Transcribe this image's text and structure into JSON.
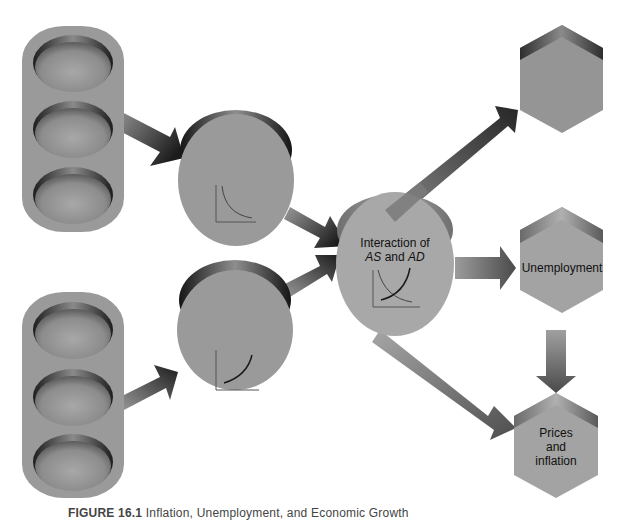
{
  "diagram": {
    "colors": {
      "background": "#ffffff",
      "shape_fill": "#9a9a9a",
      "shape_fill_light": "#a9a9a9",
      "shape_dark": "#2a2a2a",
      "arrow_dark": "#2e2e2e",
      "arrow_light": "#a0a0a0",
      "text": "#111111"
    },
    "nodes": [
      {
        "id": "top-stack",
        "shape": "stack-of-three-ovals",
        "label": ""
      },
      {
        "id": "bottom-stack",
        "shape": "stack-of-three-ovals",
        "label": ""
      },
      {
        "id": "ad-circle",
        "shape": "cylinder",
        "icon": "downward-sloping-curve",
        "label": ""
      },
      {
        "id": "as-circle",
        "shape": "cylinder",
        "icon": "upward-sloping-curve",
        "label": ""
      },
      {
        "id": "interaction-circle",
        "shape": "cylinder",
        "icon": "as-ad-crossing-curves",
        "label_line1": "Interaction of",
        "label_as": "AS",
        "label_and": " and ",
        "label_ad": "AD"
      },
      {
        "id": "top-hexagon",
        "shape": "hexagon",
        "label": ""
      },
      {
        "id": "unemployment-hexagon",
        "shape": "hexagon",
        "label": "Unemployment"
      },
      {
        "id": "prices-hexagon",
        "shape": "hexagon",
        "label_lines": [
          "Prices",
          "and",
          "inflation"
        ]
      }
    ],
    "edges": [
      {
        "from": "top-stack",
        "to": "ad-circle"
      },
      {
        "from": "bottom-stack",
        "to": "as-circle"
      },
      {
        "from": "ad-circle",
        "to": "interaction-circle"
      },
      {
        "from": "as-circle",
        "to": "interaction-circle"
      },
      {
        "from": "interaction-circle",
        "to": "top-hexagon"
      },
      {
        "from": "interaction-circle",
        "to": "unemployment-hexagon"
      },
      {
        "from": "interaction-circle",
        "to": "prices-hexagon"
      },
      {
        "from": "unemployment-hexagon",
        "to": "prices-hexagon"
      }
    ]
  },
  "caption": {
    "figure": "FIGURE 16.1",
    "text": "Inflation, Unemployment, and Economic Growth"
  }
}
